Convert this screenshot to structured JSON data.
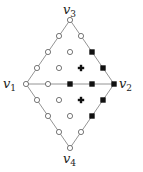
{
  "diagram": {
    "labels": [
      {
        "id": "v1",
        "base": "v",
        "sub": "1",
        "x": 3,
        "y": 88
      },
      {
        "id": "v2",
        "base": "v",
        "sub": "2",
        "x": 119,
        "y": 88
      },
      {
        "id": "v3",
        "base": "v",
        "sub": "3",
        "x": 63,
        "y": 14
      },
      {
        "id": "v4",
        "base": "v",
        "sub": "4",
        "x": 63,
        "y": 163
      }
    ],
    "colors": {
      "line": "#888888",
      "marker": "#111111",
      "fill_open": "#ffffff"
    },
    "open_points": [
      [
        70,
        20
      ],
      [
        59,
        36
      ],
      [
        48,
        52
      ],
      [
        37,
        68
      ],
      [
        26,
        84
      ],
      [
        81,
        36
      ],
      [
        48,
        84
      ],
      [
        70,
        52
      ],
      [
        59,
        68
      ],
      [
        37,
        100
      ],
      [
        48,
        116
      ],
      [
        59,
        132
      ],
      [
        70,
        148
      ],
      [
        81,
        132
      ],
      [
        59,
        100
      ],
      [
        70,
        116
      ]
    ],
    "filled_points": [
      [
        92,
        52
      ],
      [
        103,
        68
      ],
      [
        114,
        84
      ],
      [
        70,
        84
      ],
      [
        92,
        84
      ],
      [
        103,
        100
      ],
      [
        92,
        116
      ]
    ],
    "plus_points": [
      [
        81,
        68
      ],
      [
        81,
        100
      ]
    ]
  }
}
